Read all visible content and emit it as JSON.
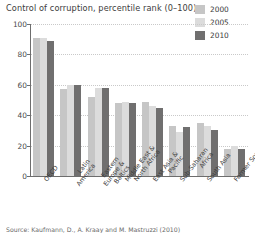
{
  "chart_data": {
    "type": "bar",
    "title": "Control of corruption, percentile rank (0–100)",
    "xlabel": "",
    "ylabel": "",
    "ylim": [
      0,
      100
    ],
    "yticks": [
      0,
      20,
      40,
      60,
      80,
      100
    ],
    "grid": true,
    "legend_position": "top-right",
    "categories": [
      "OECD",
      "Latin America",
      "Eastern Europe & Baltics",
      "Middle East & North Africa",
      "East Asia & Pacific",
      "Sub-Saharan Africa",
      "South Asia",
      "Former Soviet Union"
    ],
    "series": [
      {
        "name": "2000",
        "color": "#c6c6c6",
        "values": [
          91,
          57,
          52,
          48,
          49,
          33,
          35,
          18
        ]
      },
      {
        "name": "2005",
        "color": "#dcdcdc",
        "values": [
          91,
          60,
          58,
          49,
          46,
          29,
          33,
          20
        ]
      },
      {
        "name": "2010",
        "color": "#706f6f",
        "values": [
          89,
          60,
          58,
          48,
          45,
          32,
          30,
          18
        ]
      }
    ]
  },
  "axis": {
    "y_tick_labels": [
      "0",
      "20",
      "40",
      "60",
      "80",
      "100"
    ]
  },
  "category_labels": [
    {
      "lines": [
        "OECD"
      ]
    },
    {
      "lines": [
        "Latin",
        "America"
      ]
    },
    {
      "lines": [
        "Eastern",
        "Europe &",
        "Baltics"
      ]
    },
    {
      "lines": [
        "Middle East &",
        "North Africa"
      ]
    },
    {
      "lines": [
        "East Asia &",
        "Pacific"
      ]
    },
    {
      "lines": [
        "Sub-Saharan",
        "Africa"
      ]
    },
    {
      "lines": [
        "South Asia"
      ]
    },
    {
      "lines": [
        "Former Soviet",
        "Union"
      ]
    }
  ],
  "legend": {
    "entries": [
      {
        "label": "2000",
        "color": "#c6c6c6"
      },
      {
        "label": "2005",
        "color": "#dcdcdc"
      },
      {
        "label": "2010",
        "color": "#706f6f"
      }
    ]
  },
  "source": {
    "text": "Source: Kaufmann, D., A. Kraay and M. Mastruzzi (2010)"
  }
}
